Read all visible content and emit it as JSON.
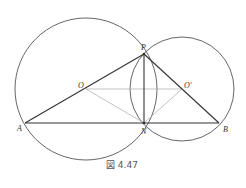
{
  "figure": {
    "caption": "図 4.47",
    "points": {
      "O": {
        "label": "O",
        "x": 86,
        "y": 89
      },
      "O2": {
        "label": "O'",
        "x": 182,
        "y": 89
      },
      "P": {
        "label": "P",
        "x": 144,
        "y": 54
      },
      "N": {
        "label": "N",
        "x": 144,
        "y": 123
      },
      "A": {
        "label": "A",
        "x": 25,
        "y": 123
      },
      "B": {
        "label": "B",
        "x": 219,
        "y": 123
      }
    },
    "circles": [
      {
        "center": "O",
        "r": 71
      },
      {
        "center": "O'",
        "r": 52
      }
    ]
  }
}
